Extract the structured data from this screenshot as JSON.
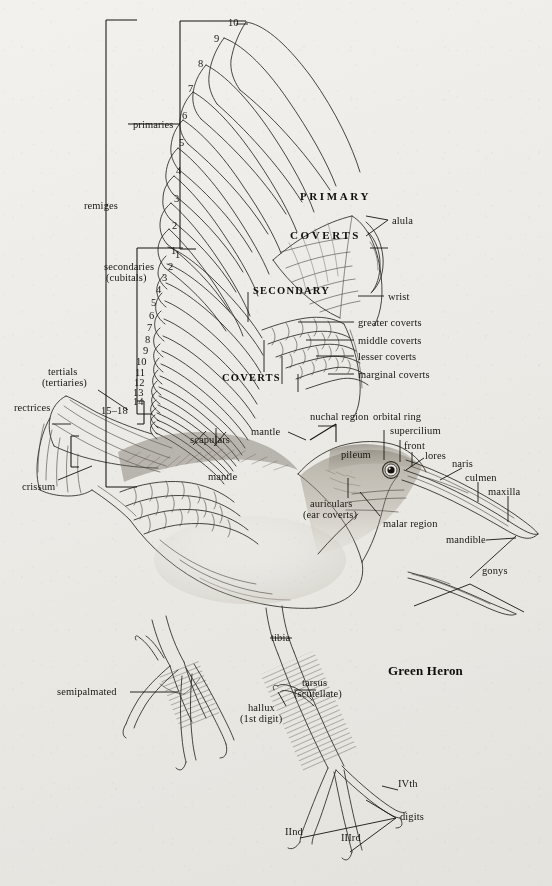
{
  "figure": {
    "species_label": "Green Heron",
    "type": "anatomical-topography-diagram",
    "medium": "pen-and-ink line drawing on toned paper",
    "background_color": "#f2f1ee",
    "ink_color": "#1a1713"
  },
  "bracket_labels": {
    "remiges": "remiges",
    "primaries": "primaries",
    "secondaries_line1": "secondaries",
    "secondaries_line2": "(cubitals)",
    "tertials_line1": "tertials",
    "tertials_line2": "(tertiaries)",
    "tertials_range": "15–18",
    "rectrices": "rectrices"
  },
  "primary_numbers": [
    "1",
    "2",
    "3",
    "4",
    "5",
    "6",
    "7",
    "8",
    "9",
    "10"
  ],
  "secondary_numbers": [
    "1",
    "2",
    "3",
    "4",
    "5",
    "6",
    "7",
    "8",
    "9",
    "10",
    "11",
    "12",
    "13",
    "14"
  ],
  "display_caps": {
    "primary": "PRIMARY",
    "primary_coverts": "COVERTS",
    "secondary": "SECONDARY",
    "secondary_coverts": "COVERTS"
  },
  "wing_labels": [
    {
      "id": "alula",
      "text": "alula"
    },
    {
      "id": "wrist",
      "text": "wrist"
    },
    {
      "id": "greater-coverts",
      "text": "greater coverts"
    },
    {
      "id": "middle-coverts",
      "text": "middle coverts"
    },
    {
      "id": "lesser-coverts",
      "text": "lesser coverts"
    },
    {
      "id": "marginal-coverts",
      "text": "marginal coverts"
    },
    {
      "id": "scapulars",
      "text": "scapulars"
    }
  ],
  "body_labels": [
    {
      "id": "crissum",
      "text": "crissum"
    },
    {
      "id": "mantle-upper",
      "text": "mantle"
    },
    {
      "id": "mantle-lower",
      "text": "mantle"
    },
    {
      "id": "tibia",
      "text": "tibia"
    }
  ],
  "head_labels": [
    {
      "id": "nuchal-region",
      "text": "nuchal region"
    },
    {
      "id": "orbital-ring",
      "text": "orbital ring"
    },
    {
      "id": "supercilium",
      "text": "supercilium"
    },
    {
      "id": "front",
      "text": "front"
    },
    {
      "id": "pileum",
      "text": "pileum"
    },
    {
      "id": "lores",
      "text": "lores"
    },
    {
      "id": "naris",
      "text": "naris"
    },
    {
      "id": "culmen",
      "text": "culmen"
    },
    {
      "id": "maxilla",
      "text": "maxilla"
    },
    {
      "id": "auriculars-line1",
      "text": "auriculars"
    },
    {
      "id": "auriculars-line2",
      "text": "(ear coverts)"
    },
    {
      "id": "malar-region",
      "text": "malar region"
    },
    {
      "id": "mandible",
      "text": "mandible"
    },
    {
      "id": "gonys",
      "text": "gonys"
    }
  ],
  "foot_labels": [
    {
      "id": "semipalmated",
      "text": "semipalmated"
    },
    {
      "id": "tarsus-line1",
      "text": "tarsus"
    },
    {
      "id": "tarsus-line2",
      "text": "(scutellate)"
    },
    {
      "id": "hallux-line1",
      "text": "hallux"
    },
    {
      "id": "hallux-line2",
      "text": "(1st digit)"
    },
    {
      "id": "digit-2",
      "text": "IInd"
    },
    {
      "id": "digit-3",
      "text": "IIIrd"
    },
    {
      "id": "digit-4",
      "text": "IVth"
    },
    {
      "id": "digits",
      "text": "digits"
    }
  ]
}
